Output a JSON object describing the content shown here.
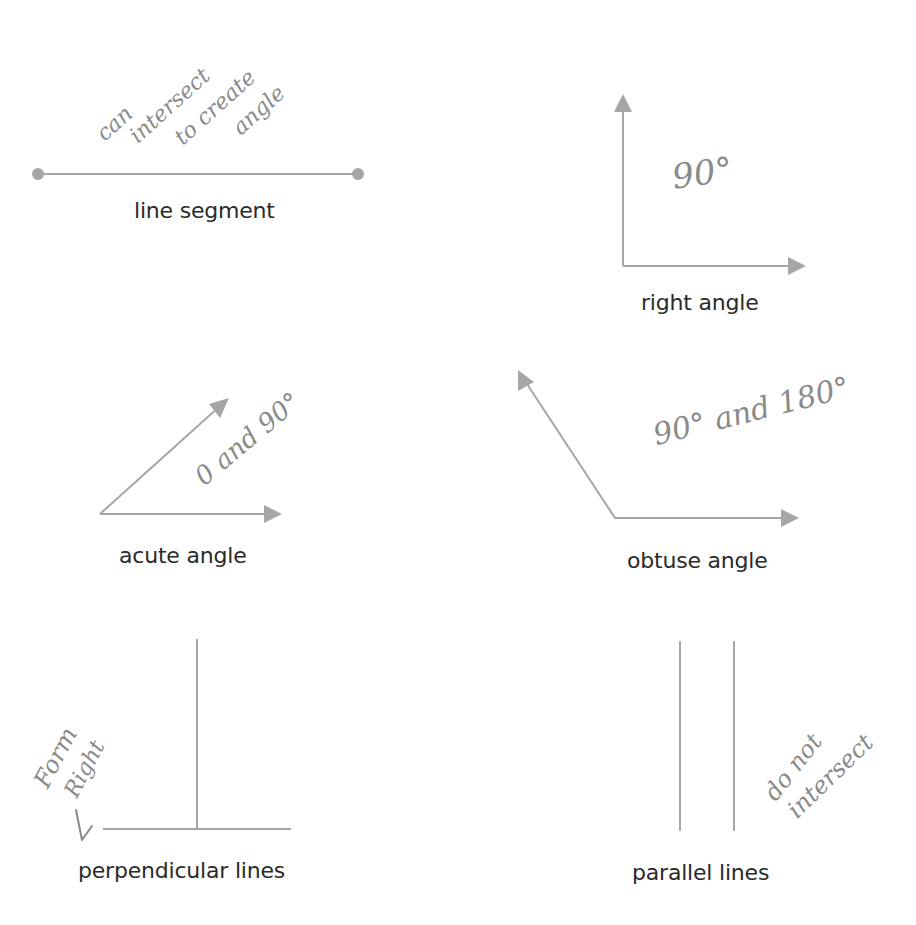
{
  "diagrams": {
    "line_segment": {
      "label": "line segment",
      "annotation_lines": [
        "can",
        "intersect",
        "to create",
        "angle"
      ]
    },
    "right_angle": {
      "label": "right angle",
      "annotation": "90°"
    },
    "acute_angle": {
      "label": "acute angle",
      "annotation": "0 and 90°"
    },
    "obtuse_angle": {
      "label": "obtuse angle",
      "annotation": "90° and 180°"
    },
    "perpendicular_lines": {
      "label": "perpendicular lines",
      "annotation_lines": [
        "Form",
        "Right"
      ]
    },
    "parallel_lines": {
      "label": "parallel lines",
      "annotation_lines": [
        "do not",
        "intersect"
      ]
    }
  },
  "colors": {
    "line": "#a6a6a6",
    "label_text": "#2a2a2a",
    "handwriting": "#8a8a8a"
  }
}
